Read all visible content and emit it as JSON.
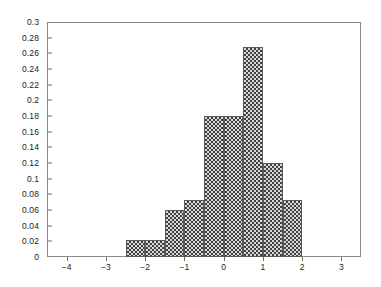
{
  "chart_data": {
    "type": "bar",
    "title": "",
    "subtitle": "",
    "xlabel": "",
    "ylabel": "",
    "xlim": [
      -4.5,
      3.5
    ],
    "ylim": [
      0,
      0.3
    ],
    "grid": false,
    "legend": null,
    "bin_width": 0.5,
    "bar_style": "checkerboard-hatch",
    "x_ticks": [
      -4,
      -3,
      -2,
      -1,
      0,
      1,
      2,
      3
    ],
    "x_tick_labels": [
      "−4",
      "−3",
      "−2",
      "−1",
      "0",
      "1",
      "2",
      "3"
    ],
    "y_ticks": [
      0,
      0.02,
      0.04,
      0.06,
      0.08,
      0.1,
      0.12,
      0.14,
      0.16,
      0.18,
      0.2,
      0.22,
      0.24,
      0.26,
      0.28,
      0.3
    ],
    "y_tick_labels": [
      "0",
      "0.02",
      "0.04",
      "0.06",
      "0.08",
      "0.1",
      "0.12",
      "0.14",
      "0.16",
      "0.18",
      "0.2",
      "0.22",
      "0.24",
      "0.26",
      "0.28",
      "0.3"
    ],
    "bins": [
      {
        "left": -2.5,
        "right": -2.0,
        "center": -2.25,
        "value": 0.022
      },
      {
        "left": -2.0,
        "right": -1.5,
        "center": -1.75,
        "value": 0.022
      },
      {
        "left": -1.5,
        "right": -1.0,
        "center": -1.25,
        "value": 0.06
      },
      {
        "left": -1.0,
        "right": -0.5,
        "center": -0.75,
        "value": 0.073
      },
      {
        "left": -0.5,
        "right": 0.0,
        "center": -0.25,
        "value": 0.18
      },
      {
        "left": 0.0,
        "right": 0.5,
        "center": 0.25,
        "value": 0.18
      },
      {
        "left": 0.5,
        "right": 1.0,
        "center": 0.75,
        "value": 0.268
      },
      {
        "left": 1.0,
        "right": 1.5,
        "center": 1.25,
        "value": 0.12
      },
      {
        "left": 1.5,
        "right": 2.0,
        "center": 1.75,
        "value": 0.073
      }
    ],
    "categories": [
      "-2.5",
      "-2.0",
      "-1.5",
      "-1.0",
      "-0.5",
      "0.0",
      "0.5",
      "1.0",
      "1.5"
    ],
    "values": [
      0.022,
      0.022,
      0.06,
      0.073,
      0.18,
      0.18,
      0.268,
      0.12,
      0.073
    ],
    "colors": {
      "bar_dark": "#414141",
      "bar_light": "#d9d9d9",
      "bar_border": "#5a5a5a",
      "axis": "#8a8a8a",
      "text": "#1a1a1a"
    }
  }
}
